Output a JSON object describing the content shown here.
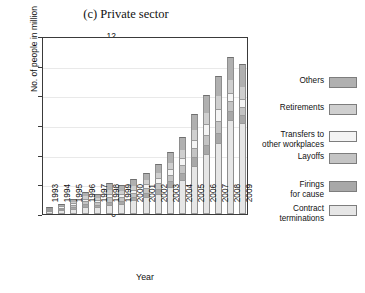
{
  "chart_data": {
    "type": "bar",
    "subtype": "stacked-bar",
    "title": "(c) Private sector",
    "xlabel": "Year",
    "ylabel": "No. of people in million",
    "ylim": [
      0,
      12
    ],
    "yticks": [
      0,
      2,
      4,
      6,
      8,
      10,
      12
    ],
    "grid": true,
    "legend_position": "right",
    "categories": [
      "1993",
      "1994",
      "1995",
      "1996",
      "1997",
      "1998",
      "1999",
      "2000",
      "2001",
      "2002",
      "2003",
      "2004",
      "2005",
      "2006",
      "2007",
      "2008",
      "2009"
    ],
    "series": [
      {
        "name": "Contract terminations",
        "color": "#e6e6e6",
        "values": [
          0.12,
          0.18,
          0.28,
          0.42,
          0.4,
          0.55,
          0.6,
          0.85,
          1.1,
          1.3,
          1.75,
          2.25,
          3.2,
          3.95,
          4.7,
          6.3,
          6.1
        ]
      },
      {
        "name": "Firings for cause",
        "color": "#a8a8a8",
        "values": [
          0.08,
          0.1,
          0.14,
          0.18,
          0.16,
          0.22,
          0.2,
          0.22,
          0.26,
          0.32,
          0.38,
          0.45,
          0.55,
          0.62,
          0.7,
          0.6,
          0.52
        ]
      },
      {
        "name": "Layoffs",
        "color": "#c4c4c4",
        "values": [
          0.06,
          0.09,
          0.13,
          0.2,
          0.18,
          0.28,
          0.25,
          0.26,
          0.3,
          0.38,
          0.42,
          0.52,
          0.62,
          0.72,
          0.82,
          0.62,
          0.55
        ]
      },
      {
        "name": "Transfers to other workplaces",
        "color": "#f4f4f4",
        "values": [
          0.05,
          0.08,
          0.11,
          0.17,
          0.15,
          0.25,
          0.22,
          0.24,
          0.28,
          0.34,
          0.4,
          0.48,
          0.58,
          0.68,
          0.78,
          0.58,
          0.5
        ]
      },
      {
        "name": "Retirements",
        "color": "#cfcfcf",
        "values": [
          0.07,
          0.11,
          0.16,
          0.23,
          0.21,
          0.33,
          0.3,
          0.32,
          0.36,
          0.44,
          0.52,
          0.6,
          0.72,
          0.82,
          0.94,
          0.92,
          0.88
        ]
      },
      {
        "name": "Others",
        "color": "#b0b0b0",
        "values": [
          0.09,
          0.14,
          0.2,
          0.3,
          0.27,
          0.45,
          0.42,
          0.45,
          0.5,
          0.62,
          0.73,
          0.9,
          1.05,
          1.21,
          1.36,
          1.58,
          1.55
        ]
      }
    ],
    "totals": [
      0.47,
      0.7,
      1.02,
      1.5,
      1.37,
      2.08,
      1.99,
      2.34,
      2.8,
      3.4,
      4.2,
      5.2,
      6.72,
      8.0,
      9.3,
      10.6,
      10.1
    ]
  },
  "legend": {
    "entries": [
      {
        "label": "Others",
        "color": "#b0b0b0"
      },
      {
        "label": "Retirements",
        "color": "#cfcfcf"
      },
      {
        "label": "Transfers to\nother workplaces",
        "color": "#f4f4f4"
      },
      {
        "label": "Layoffs",
        "color": "#c4c4c4"
      },
      {
        "label": "Firings\nfor cause",
        "color": "#a8a8a8"
      },
      {
        "label": "Contract\nterminations",
        "color": "#e6e6e6"
      }
    ]
  }
}
